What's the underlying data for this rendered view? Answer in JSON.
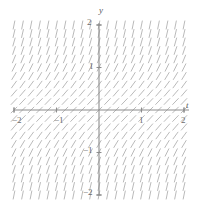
{
  "chart_data": {
    "type": "scatter",
    "subtype": "slope-field",
    "title": "",
    "xlabel": "t",
    "ylabel": "y",
    "xlim": [
      -2,
      2
    ],
    "ylim": [
      -2,
      2
    ],
    "grid": false,
    "legend": null,
    "equation": "y' = 1 + y^2",
    "x_ticks": [
      -2,
      -1,
      1,
      2
    ],
    "x_tick_labels": [
      "−2",
      "−1",
      "1",
      "2"
    ],
    "y_ticks": [
      -2,
      -1,
      1,
      2
    ],
    "y_tick_labels": [
      "−2",
      "−1",
      "1",
      "2"
    ],
    "field": {
      "description": "Direction field: at each grid point (t,y) a short segment is drawn with slope 1 + y^2; slope is independent of t, equals 1 (45 degrees) on the t-axis and becomes nearly vertical as |y| grows.",
      "slope_formula_a": 1,
      "slope_formula_b": 1,
      "grid_columns": 21,
      "grid_rows": 21,
      "t_min": -2.0,
      "t_max": 2.0,
      "y_min": -2.0,
      "y_max": 2.0,
      "segment_length_px": 9,
      "sample_slopes": [
        {
          "y": -2.0,
          "slope": 5.0
        },
        {
          "y": -1.5,
          "slope": 3.25
        },
        {
          "y": -1.0,
          "slope": 2.0
        },
        {
          "y": -0.5,
          "slope": 1.25
        },
        {
          "y": 0.0,
          "slope": 1.0
        },
        {
          "y": 0.5,
          "slope": 1.25
        },
        {
          "y": 1.0,
          "slope": 2.0
        },
        {
          "y": 1.5,
          "slope": 3.25
        },
        {
          "y": 2.0,
          "slope": 5.0
        }
      ]
    },
    "colors": {
      "segment": "#9a9a9a",
      "axis": "#8c8c8c",
      "text": "#6b6b6b",
      "background": "#ffffff"
    },
    "geometry": {
      "origin_x_px": 99,
      "origin_y_px": 110,
      "px_per_unit_x": 42.5,
      "px_per_unit_y": 42.5,
      "tick_len_px": 5
    }
  }
}
